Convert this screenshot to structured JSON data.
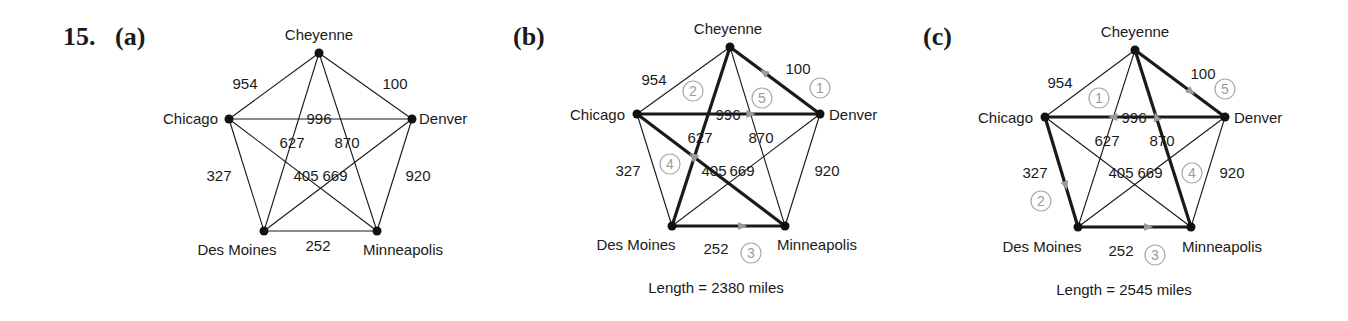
{
  "problem_label": "15.",
  "panels": [
    {
      "id": "a",
      "label": "(a)",
      "length_text": null,
      "tour": []
    },
    {
      "id": "b",
      "label": "(b)",
      "length_text": "Length = 2380 miles",
      "tour": [
        {
          "step": "1",
          "from": "Denver",
          "to": "Cheyenne"
        },
        {
          "step": "2",
          "from": "Cheyenne",
          "to": "Des Moines"
        },
        {
          "step": "3",
          "from": "Des Moines",
          "to": "Minneapolis"
        },
        {
          "step": "4",
          "from": "Minneapolis",
          "to": "Chicago"
        },
        {
          "step": "5",
          "from": "Chicago",
          "to": "Denver"
        }
      ]
    },
    {
      "id": "c",
      "label": "(c)",
      "length_text": "Length = 2545 miles",
      "tour": [
        {
          "step": "1",
          "from": "Denver",
          "to": "Chicago"
        },
        {
          "step": "2",
          "from": "Chicago",
          "to": "Des Moines"
        },
        {
          "step": "3",
          "from": "Des Moines",
          "to": "Minneapolis"
        },
        {
          "step": "4",
          "from": "Minneapolis",
          "to": "Cheyenne"
        },
        {
          "step": "5",
          "from": "Cheyenne",
          "to": "Denver"
        }
      ]
    }
  ],
  "nodes": [
    "Cheyenne",
    "Chicago",
    "Denver",
    "Des Moines",
    "Minneapolis"
  ],
  "edges": [
    {
      "a": "Cheyenne",
      "b": "Chicago",
      "weight": "954"
    },
    {
      "a": "Cheyenne",
      "b": "Denver",
      "weight": "100"
    },
    {
      "a": "Chicago",
      "b": "Denver",
      "weight": "996"
    },
    {
      "a": "Cheyenne",
      "b": "Des Moines",
      "weight": "627"
    },
    {
      "a": "Cheyenne",
      "b": "Minneapolis",
      "weight": "870"
    },
    {
      "a": "Chicago",
      "b": "Des Moines",
      "weight": "327"
    },
    {
      "a": "Denver",
      "b": "Minneapolis",
      "weight": "920"
    },
    {
      "a": "Chicago",
      "b": "Minneapolis",
      "weight": "405"
    },
    {
      "a": "Denver",
      "b": "Des Moines",
      "weight": "669"
    },
    {
      "a": "Des Moines",
      "b": "Minneapolis",
      "weight": "252"
    }
  ]
}
